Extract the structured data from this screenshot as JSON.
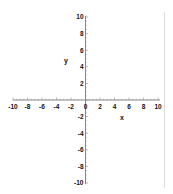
{
  "chart_data": {
    "type": "line",
    "title": "",
    "xlabel": "x",
    "ylabel": "y",
    "xlim": [
      -10,
      10
    ],
    "ylim": [
      -10,
      10
    ],
    "x_ticks": [
      -10,
      -8,
      -6,
      -4,
      -2,
      0,
      2,
      4,
      6,
      8,
      10
    ],
    "y_ticks": [
      -10,
      -8,
      -6,
      -4,
      -2,
      2,
      4,
      6,
      8,
      10
    ],
    "x_tick_labels": [
      "-10",
      "-8",
      "-6",
      "-4",
      "-2",
      "0",
      "2",
      "4",
      "6",
      "8",
      "10"
    ],
    "y_tick_labels": [
      "-10",
      "-8",
      "-6",
      "-4",
      "-2",
      "2",
      "4",
      "6",
      "8",
      "10"
    ],
    "grid": false,
    "legend": null,
    "series": []
  },
  "colors": {
    "axis": "#888888",
    "text": "#111111",
    "border": "#dddddd"
  }
}
